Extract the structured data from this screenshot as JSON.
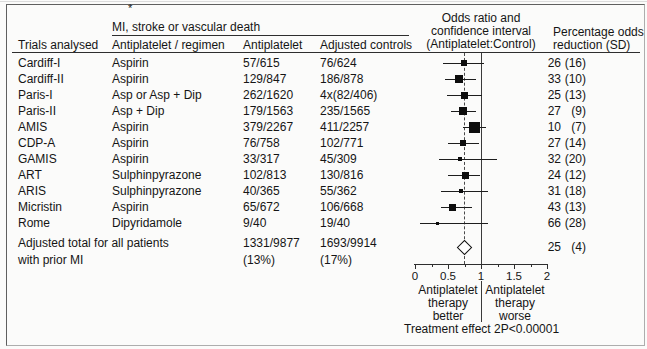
{
  "header": {
    "footnote_marker": "*",
    "outcome_title": "MI, stroke or vascular death",
    "col_trials": "Trials analysed",
    "col_regimen": "Antiplatelet / regimen",
    "col_antiplatelet": "Antiplatelet",
    "col_controls": "Adjusted controls",
    "or_lines": [
      "Odds ratio and",
      "confidence interval",
      "(Antiplatelet:Control)"
    ],
    "pct_lines": [
      "Percentage odds",
      "reduction (SD)"
    ]
  },
  "chart_data": {
    "type": "forest",
    "title": "Odds ratio and confidence interval (Antiplatelet:Control)",
    "x_axis": {
      "min": 0,
      "max": 2,
      "major_ticks": [
        0,
        0.5,
        1,
        1.5,
        2
      ],
      "tick_labels": [
        "0",
        "0.5",
        "1",
        "1.5",
        "2"
      ],
      "minor_ticks": [
        0.25,
        0.75,
        1.25,
        1.75
      ]
    },
    "reference_line": 1,
    "overall_dashed_line": 0.75,
    "rows": [
      {
        "trial": "Cardiff-I",
        "regimen": "Aspirin",
        "antiplatelet": "57/615",
        "controls": "76/624",
        "or": 0.74,
        "ci": [
          0.42,
          1.04
        ],
        "marker_px": 6,
        "pct": "26",
        "sd": "(16)"
      },
      {
        "trial": "Cardiff-II",
        "regimen": "Aspirin",
        "antiplatelet": "129/847",
        "controls": "186/878",
        "or": 0.67,
        "ci": [
          0.46,
          0.93
        ],
        "marker_px": 8,
        "pct": "33",
        "sd": "(10)"
      },
      {
        "trial": "Paris-I",
        "regimen": "Asp or Asp + Dip",
        "antiplatelet": "262/1620",
        "controls": "4x(82/406)",
        "or": 0.75,
        "ci": [
          0.49,
          1.02
        ],
        "marker_px": 7,
        "pct": "25",
        "sd": "(13)"
      },
      {
        "trial": "Paris-II",
        "regimen": "Asp + Dip",
        "antiplatelet": "179/1563",
        "controls": "235/1565",
        "or": 0.73,
        "ci": [
          0.54,
          0.93
        ],
        "marker_px": 8,
        "pct": "27",
        "sd": "(9)"
      },
      {
        "trial": "AMIS",
        "regimen": "Aspirin",
        "antiplatelet": "379/2267",
        "controls": "411/2257",
        "or": 0.9,
        "ci": [
          0.72,
          1.08
        ],
        "marker_px": 11,
        "pct": "10",
        "sd": "(7)"
      },
      {
        "trial": "CDP-A",
        "regimen": "Aspirin",
        "antiplatelet": "76/758",
        "controls": "102/771",
        "or": 0.73,
        "ci": [
          0.5,
          0.97
        ],
        "marker_px": 6,
        "pct": "27",
        "sd": "(14)"
      },
      {
        "trial": "GAMIS",
        "regimen": "Aspirin",
        "antiplatelet": "33/317",
        "controls": "45/309",
        "or": 0.68,
        "ci": [
          0.36,
          1.25
        ],
        "marker_px": 4,
        "pct": "32",
        "sd": "(20)"
      },
      {
        "trial": "ART",
        "regimen": "Sulphinpyrazone",
        "antiplatelet": "102/813",
        "controls": "130/816",
        "or": 0.76,
        "ci": [
          0.5,
          0.99
        ],
        "marker_px": 7,
        "pct": "24",
        "sd": "(12)"
      },
      {
        "trial": "ARIS",
        "regimen": "Sulphinpyrazone",
        "antiplatelet": "40/365",
        "controls": "55/362",
        "or": 0.69,
        "ci": [
          0.4,
          1.1
        ],
        "marker_px": 4,
        "pct": "31",
        "sd": "(18)"
      },
      {
        "trial": "Micristin",
        "regimen": "Aspirin",
        "antiplatelet": "65/672",
        "controls": "106/668",
        "or": 0.57,
        "ci": [
          0.4,
          0.87
        ],
        "marker_px": 7,
        "pct": "43",
        "sd": "(13)"
      },
      {
        "trial": "Rome",
        "regimen": "Dipyridamole",
        "antiplatelet": "9/40",
        "controls": "19/40",
        "or": 0.34,
        "ci": [
          0.07,
          1.1
        ],
        "marker_px": 3,
        "pct": "66",
        "sd": "(28)"
      }
    ],
    "total": {
      "label_line1": "Adjusted total for all patients",
      "label_line2": "with prior MI",
      "antiplatelet": "1331/9877",
      "antiplatelet_pct": "(13%)",
      "controls": "1693/9914",
      "controls_pct": "(17%)",
      "or": 0.75,
      "ci": [
        0.64,
        0.86
      ],
      "pct": "25",
      "sd": "(4)"
    },
    "axis_labels": {
      "left_lines": [
        "Antiplatelet",
        "therapy",
        "better"
      ],
      "right_lines": [
        "Antiplatelet",
        "therapy",
        "worse"
      ]
    },
    "treatment_effect": "Treatment effect 2P<0.00001",
    "colors": {
      "marker": "#0d0d0d",
      "text": "#151515"
    }
  }
}
